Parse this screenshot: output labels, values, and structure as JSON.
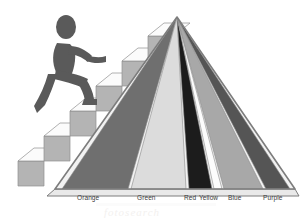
{
  "figure": {
    "type": "diagram",
    "background": "#ffffff"
  },
  "pyramid": {
    "name": "color-band-pyramid",
    "apex": {
      "x": 177,
      "y": 17
    },
    "base_left": {
      "x": 55,
      "y": 189
    },
    "base_right": {
      "x": 295,
      "y": 189
    },
    "outline_color": "#7d7d7d",
    "base_fill": "#e9e9e9",
    "bands": [
      {
        "label": "Orange",
        "fill": "#6f6f6f",
        "base_from": 62,
        "base_to": 128,
        "label_x": 77,
        "label_y": 194
      },
      {
        "label": "Green",
        "fill": "#dcdcdc",
        "base_from": 131,
        "base_to": 186,
        "label_x": 137,
        "label_y": 194
      },
      {
        "label": "Red",
        "fill": "#1c1c1c",
        "base_from": 189,
        "base_to": 212,
        "label_x": 184,
        "label_y": 194
      },
      {
        "label": "Yellow",
        "fill": "#fcfcfc",
        "base_from": 214,
        "base_to": 222,
        "label_x": 199,
        "label_y": 194
      },
      {
        "label": "Blue",
        "fill": "#a8a8a8",
        "base_from": 224,
        "base_to": 263,
        "label_x": 228,
        "label_y": 194
      },
      {
        "label": "Purple",
        "fill": "#555555",
        "base_from": 266,
        "base_to": 290,
        "label_x": 263,
        "label_y": 194
      }
    ]
  },
  "staircase": {
    "name": "ascending-staircase",
    "step_count": 6,
    "tread_color": "#fbfbfb",
    "riser_color": "#b4b4b4",
    "edge_color": "#8f8f8f"
  },
  "climber": {
    "name": "climbing-figure",
    "fill": "#5a5a5a",
    "description": "silhouette of a person striding up the stairs"
  },
  "watermark": {
    "text": "fotosearch",
    "color": "#f3f1ef"
  },
  "labels": {
    "row_y": 194,
    "color": "#3a3a3a"
  }
}
